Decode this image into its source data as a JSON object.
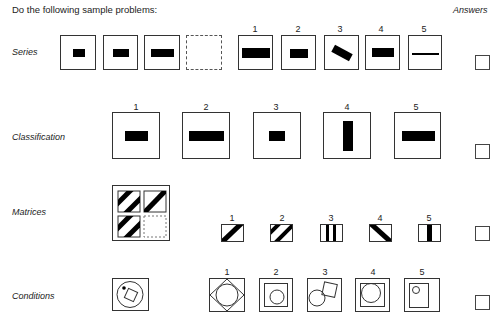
{
  "header": {
    "title": "Do the following sample problems:",
    "answers_label": "Answers"
  },
  "rows": [
    {
      "label": "Series",
      "stimulus": [
        "small horizontal bar",
        "medium horizontal bar",
        "long horizontal bar",
        "empty dashed box"
      ],
      "options": [
        {
          "number": "1",
          "figure": "long thick horizontal bar"
        },
        {
          "number": "2",
          "figure": "medium horizontal bar"
        },
        {
          "number": "3",
          "figure": "tilted bar"
        },
        {
          "number": "4",
          "figure": "medium-long horizontal bar"
        },
        {
          "number": "5",
          "figure": "thin horizontal line"
        }
      ],
      "answer": ""
    },
    {
      "label": "Classification",
      "options": [
        {
          "number": "1",
          "figure": "medium horizontal bar"
        },
        {
          "number": "2",
          "figure": "long horizontal bar"
        },
        {
          "number": "3",
          "figure": "small horizontal bar"
        },
        {
          "number": "4",
          "figure": "vertical bar"
        },
        {
          "number": "5",
          "figure": "long horizontal bar"
        }
      ],
      "answer": ""
    },
    {
      "label": "Matrices",
      "stimulus": [
        "two diagonal stripes",
        "one diagonal stripe",
        "two diagonal stripes",
        "empty dashed cell"
      ],
      "options": [
        {
          "number": "1",
          "figure": "one diagonal stripe"
        },
        {
          "number": "2",
          "figure": "two diagonal stripes"
        },
        {
          "number": "3",
          "figure": "two vertical stripes"
        },
        {
          "number": "4",
          "figure": "one reverse diagonal stripe"
        },
        {
          "number": "5",
          "figure": "one vertical stripe"
        }
      ],
      "answer": ""
    },
    {
      "label": "Conditions",
      "stimulus": [
        "circle with dot outside tilted square inside circle"
      ],
      "options": [
        {
          "number": "1",
          "figure": "circle inside diamond"
        },
        {
          "number": "2",
          "figure": "circle inside square"
        },
        {
          "number": "3",
          "figure": "overlapping circle and tilted square"
        },
        {
          "number": "4",
          "figure": "circle overlapping square"
        },
        {
          "number": "5",
          "figure": "small circle inside rectangle"
        }
      ],
      "answer": ""
    }
  ]
}
